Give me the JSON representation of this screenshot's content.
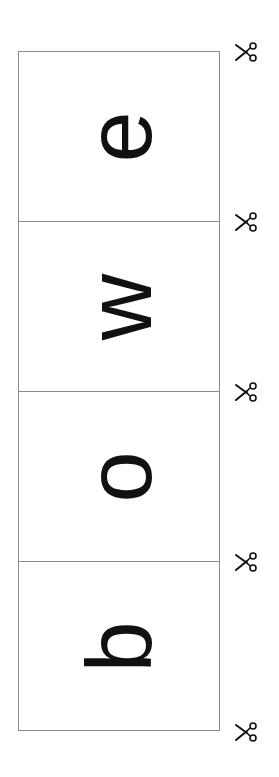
{
  "strip": {
    "cells": [
      {
        "letter": "e"
      },
      {
        "letter": "w"
      },
      {
        "letter": "o"
      },
      {
        "letter": "b"
      }
    ],
    "reading_word": "bowe",
    "rotation_deg": -90
  },
  "cut_marks": {
    "icon": "scissors-icon",
    "count": 5
  },
  "colors": {
    "border": "#8a8a8a",
    "ink": "#111111",
    "background": "#ffffff"
  }
}
